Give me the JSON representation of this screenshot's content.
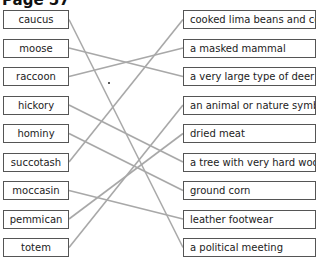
{
  "page": {
    "title": "Page 57"
  },
  "terms": [
    {
      "label": "caucus"
    },
    {
      "label": "moose"
    },
    {
      "label": "raccoon"
    },
    {
      "label": "hickory"
    },
    {
      "label": "hominy"
    },
    {
      "label": "succotash"
    },
    {
      "label": "moccasin"
    },
    {
      "label": "pemmican"
    },
    {
      "label": "totem"
    }
  ],
  "definitions": [
    {
      "label": "cooked lima beans and corn"
    },
    {
      "label": "a masked mammal"
    },
    {
      "label": "a very large type of deer"
    },
    {
      "label": "an animal or nature symbol"
    },
    {
      "label": "dried meat"
    },
    {
      "label": "a tree with very hard wood"
    },
    {
      "label": "ground corn"
    },
    {
      "label": "leather footwear"
    },
    {
      "label": "a political meeting"
    }
  ],
  "matches": [
    {
      "term": "caucus",
      "definition": "a political meeting",
      "from": 0,
      "to": 8
    },
    {
      "term": "moose",
      "definition": "a very large type of deer",
      "from": 1,
      "to": 2
    },
    {
      "term": "raccoon",
      "definition": "a masked mammal",
      "from": 2,
      "to": 1
    },
    {
      "term": "hickory",
      "definition": "a tree with very hard wood",
      "from": 3,
      "to": 5
    },
    {
      "term": "hominy",
      "definition": "ground corn",
      "from": 4,
      "to": 6
    },
    {
      "term": "succotash",
      "definition": "cooked lima beans and corn",
      "from": 5,
      "to": 0
    },
    {
      "term": "moccasin",
      "definition": "leather footwear",
      "from": 6,
      "to": 7
    },
    {
      "term": "pemmican",
      "definition": "dried meat",
      "from": 7,
      "to": 4
    },
    {
      "term": "totem",
      "definition": "an animal or nature symbol",
      "from": 8,
      "to": 3
    }
  ],
  "colors": {
    "line": "#a8a8a8",
    "box_border": "#555555",
    "text": "#222222"
  }
}
